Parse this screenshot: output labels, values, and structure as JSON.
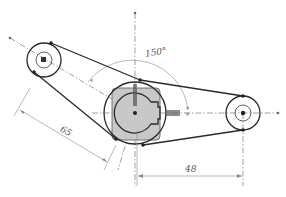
{
  "drawing": {
    "type": "2d-sketch",
    "description": "Belt/linkage sketch: central hub with keyed bore, two pulleys connected by tangent lines",
    "colors": {
      "line": "#2a2a2a",
      "centerline": "#7a7a7a",
      "dimension": "#8a8a8a",
      "hub_fill": "#c8c8c8",
      "background": "#ffffff"
    },
    "dimensions": {
      "angle_label": "150°",
      "angled_length_label": "65",
      "horizontal_length_label": "48"
    },
    "features": {
      "hub": {
        "name": "central-hub",
        "has_square_fill": true,
        "has_keyway": true
      },
      "left_pulley": {
        "name": "left-pulley",
        "rings": 2
      },
      "right_pulley": {
        "name": "right-pulley",
        "rings": 2
      }
    }
  }
}
